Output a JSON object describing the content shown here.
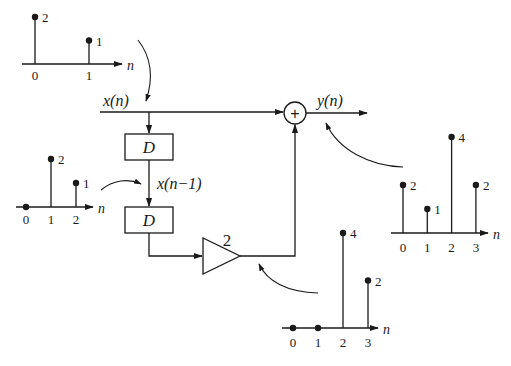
{
  "diagram": {
    "input_label": "x(n)",
    "delayed_label": "x(n−1)",
    "output_label": "y(n)",
    "delay_blocks": [
      {
        "label": "D"
      },
      {
        "label": "D"
      }
    ],
    "gain": {
      "label": "2"
    },
    "adder": {
      "symbol": "+"
    },
    "axis_label": "n"
  },
  "chart_data": [
    {
      "type": "stem",
      "name": "input x(n)",
      "x": [
        0,
        1
      ],
      "values": [
        2,
        1
      ],
      "value_labels": [
        "2",
        "1"
      ],
      "tick_labels": [
        "0",
        "1"
      ],
      "xlabel": "n"
    },
    {
      "type": "stem",
      "name": "delayed x(n-1)",
      "x": [
        0,
        1,
        2
      ],
      "values": [
        0,
        2,
        1
      ],
      "value_labels": [
        "",
        "2",
        "1"
      ],
      "tick_labels": [
        "0",
        "1",
        "2"
      ],
      "xlabel": "n"
    },
    {
      "type": "stem",
      "name": "scaled 2x(n-2)",
      "x": [
        0,
        1,
        2,
        3
      ],
      "values": [
        0,
        0,
        4,
        2
      ],
      "value_labels": [
        "",
        "",
        "4",
        "2"
      ],
      "tick_labels": [
        "0",
        "1",
        "2",
        "3"
      ],
      "xlabel": "n"
    },
    {
      "type": "stem",
      "name": "output y(n)",
      "x": [
        0,
        1,
        2,
        3
      ],
      "values": [
        2,
        1,
        4,
        2
      ],
      "value_labels": [
        "2",
        "1",
        "4",
        "2"
      ],
      "tick_labels": [
        "0",
        "1",
        "2",
        "3"
      ],
      "xlabel": "n"
    }
  ]
}
